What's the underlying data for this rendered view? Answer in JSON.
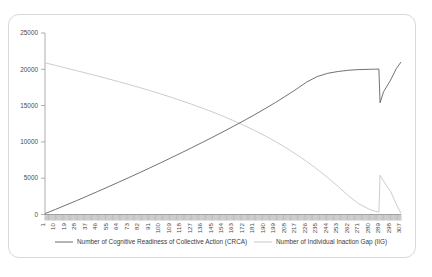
{
  "figure": {
    "caption": "",
    "legend_position": "bottom"
  },
  "chart_data": {
    "type": "line",
    "title": "",
    "xlabel": "",
    "ylabel": "",
    "xlim": [
      1,
      307
    ],
    "ylim": [
      0,
      25000
    ],
    "grid": false,
    "legend_position": "bottom",
    "y_ticks": [
      "0",
      "5000",
      "10000",
      "15000",
      "20000",
      "25000"
    ],
    "y_tick_values": [
      0,
      5000,
      10000,
      15000,
      20000,
      25000
    ],
    "x_ticks": [
      "1",
      "10",
      "19",
      "28",
      "37",
      "46",
      "55",
      "64",
      "73",
      "82",
      "91",
      "100",
      "109",
      "118",
      "127",
      "136",
      "145",
      "154",
      "163",
      "172",
      "181",
      "190",
      "199",
      "208",
      "217",
      "226",
      "235",
      "244",
      "253",
      "262",
      "271",
      "280",
      "289",
      "298",
      "307"
    ],
    "x_tick_values": [
      1,
      10,
      19,
      28,
      37,
      46,
      55,
      64,
      73,
      82,
      91,
      100,
      109,
      118,
      127,
      136,
      145,
      154,
      163,
      172,
      181,
      190,
      199,
      208,
      217,
      226,
      235,
      244,
      253,
      262,
      271,
      280,
      289,
      298,
      307
    ],
    "x_minor_tick_count": 307,
    "series": [
      {
        "name": "Number of Cognitive Readiness of Collective Action (CRCA)",
        "color": "#595959",
        "x": [
          1,
          10,
          19,
          28,
          37,
          46,
          55,
          64,
          73,
          82,
          91,
          100,
          109,
          118,
          127,
          136,
          145,
          154,
          163,
          172,
          181,
          190,
          199,
          208,
          217,
          226,
          235,
          244,
          253,
          262,
          271,
          280,
          285,
          288,
          289,
          292,
          298,
          303,
          307
        ],
        "values": [
          120,
          700,
          1300,
          1900,
          2520,
          3150,
          3780,
          4430,
          5080,
          5740,
          6410,
          7090,
          7780,
          8480,
          9190,
          9910,
          10640,
          11390,
          12150,
          12930,
          13730,
          14560,
          15420,
          16320,
          17260,
          18250,
          19000,
          19450,
          19700,
          19870,
          19960,
          20000,
          20020,
          20030,
          15400,
          16900,
          18500,
          20100,
          21000
        ]
      },
      {
        "name": "Number of Individual Inaction Gap (IIG)",
        "color": "#c3c3c3",
        "x": [
          1,
          10,
          19,
          28,
          37,
          46,
          55,
          64,
          73,
          82,
          91,
          100,
          109,
          118,
          127,
          136,
          145,
          154,
          163,
          172,
          181,
          190,
          199,
          208,
          217,
          226,
          235,
          244,
          253,
          262,
          271,
          280,
          285,
          288,
          289,
          292,
          298,
          303,
          307
        ],
        "values": [
          20900,
          20540,
          20180,
          19820,
          19450,
          19080,
          18700,
          18310,
          17910,
          17500,
          17070,
          16630,
          16170,
          15690,
          15190,
          14670,
          14120,
          13540,
          12930,
          12280,
          11590,
          10850,
          10060,
          9210,
          8290,
          7300,
          6230,
          5080,
          3850,
          2560,
          1450,
          700,
          430,
          330,
          5400,
          4600,
          3200,
          1400,
          150
        ]
      }
    ]
  },
  "legend": {
    "items": [
      {
        "label": "Number of Cognitive Readiness of Collective Action (CRCA)",
        "color": "#595959"
      },
      {
        "label": "Number of Individual Inaction Gap (IIG)",
        "color": "#c3c3c3"
      }
    ]
  }
}
